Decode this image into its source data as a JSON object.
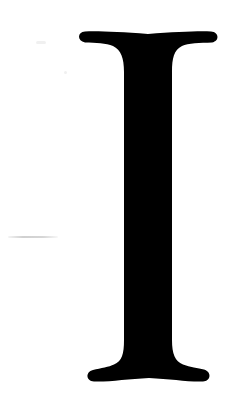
{
  "glyph": {
    "character": "I",
    "description": "Large serif capital letter I",
    "fill_color": "#000000",
    "background_color": "#ffffff"
  },
  "artifacts": {
    "faint_line_color": "#d4d4d4"
  }
}
